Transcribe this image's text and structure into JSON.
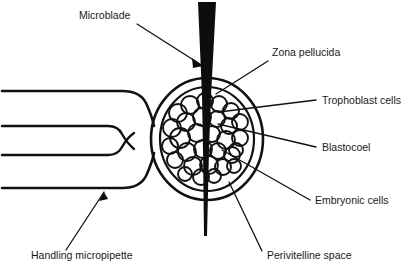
{
  "figure": {
    "background_color": "#ffffff",
    "ink_color": "#111111",
    "width": 409,
    "height": 273
  },
  "labels": {
    "microblade": "Microblade",
    "zona_pellucida": "Zona pellucida",
    "trophoblast_cells": "Trophoblast cells",
    "blastocoel": "Blastocoel",
    "embryonic_cells": "Embryonic cells",
    "perivitelline_space": "Perivitelline space",
    "handling_micropipette": "Handling micropipette"
  },
  "parts": [
    {
      "id": "microblade",
      "label": "Microblade",
      "description": "tapered black wedge blade entering embryo from top",
      "label_x": 79,
      "label_y": 19,
      "leader_from": [
        137,
        24
      ],
      "leader_to": [
        203,
        66
      ]
    },
    {
      "id": "zona-pellucida",
      "label": "Zona pellucida",
      "description": "outer glycoprotein shell of the blastocyst",
      "label_x": 272,
      "label_y": 56,
      "leader_from": [
        268,
        61
      ],
      "leader_to": [
        216,
        94
      ]
    },
    {
      "id": "trophoblast-cells",
      "label": "Trophoblast cells",
      "description": "outer cell layer of blastocyst",
      "label_x": 322,
      "label_y": 104,
      "leader_from": [
        316,
        100
      ],
      "leader_to": [
        219,
        112
      ]
    },
    {
      "id": "blastocoel",
      "label": "Blastocoel",
      "description": "fluid filled cavity inside blastocyst",
      "label_x": 322,
      "label_y": 151,
      "leader_from": [
        316,
        147
      ],
      "leader_to": [
        218,
        124
      ]
    },
    {
      "id": "embryonic-cells",
      "label": "Embryonic cells",
      "description": "inner cell mass",
      "label_x": 315,
      "label_y": 204,
      "leader_from": [
        310,
        200
      ],
      "leader_to": [
        222,
        150
      ]
    },
    {
      "id": "perivitelline-space",
      "label": "Perivitelline space",
      "description": "gap between zona pellucida and cell mass",
      "label_x": 267,
      "label_y": 259,
      "leader_from": [
        262,
        251
      ],
      "leader_to": [
        229,
        182
      ]
    },
    {
      "id": "handling-micropipette",
      "label": "Handling micropipette",
      "description": "suction pipette holding the embryo from the left",
      "label_x": 31,
      "label_y": 259,
      "leader_from": [
        66,
        250
      ],
      "leader_to": [
        104,
        192
      ]
    }
  ],
  "embryo": {
    "center_x": 207,
    "center_y": 139,
    "zona_outer_radius": 56,
    "zona_inner_radius": 48,
    "cell_mass_radius": 35
  }
}
